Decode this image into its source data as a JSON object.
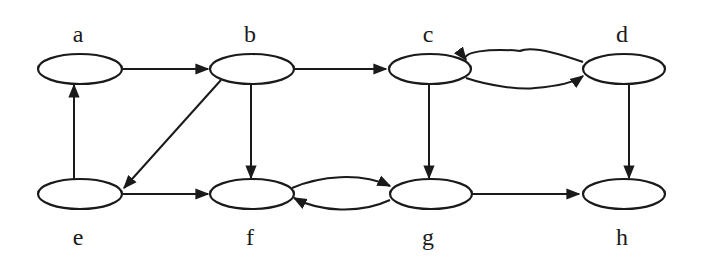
{
  "diagram": {
    "type": "directed-graph",
    "colors": {
      "stroke": "#1a1a1a",
      "background": "#ffffff",
      "node_fill": "#ffffff"
    },
    "nodes": [
      {
        "id": "a",
        "label": "a",
        "cx": 80,
        "cy": 69,
        "label_x": 78,
        "label_y": 42
      },
      {
        "id": "b",
        "label": "b",
        "cx": 252,
        "cy": 69,
        "label_x": 250,
        "label_y": 42
      },
      {
        "id": "c",
        "label": "c",
        "cx": 430,
        "cy": 69,
        "label_x": 428,
        "label_y": 42
      },
      {
        "id": "d",
        "label": "d",
        "cx": 623,
        "cy": 69,
        "label_x": 622,
        "label_y": 42
      },
      {
        "id": "e",
        "label": "e",
        "cx": 80,
        "cy": 194,
        "label_x": 78,
        "label_y": 245
      },
      {
        "id": "f",
        "label": "f",
        "cx": 252,
        "cy": 194,
        "label_x": 250,
        "label_y": 245
      },
      {
        "id": "g",
        "label": "g",
        "cx": 430,
        "cy": 194,
        "label_x": 428,
        "label_y": 245
      },
      {
        "id": "h",
        "label": "h",
        "cx": 623,
        "cy": 194,
        "label_x": 622,
        "label_y": 245
      }
    ],
    "edges": [
      {
        "from": "a",
        "to": "b"
      },
      {
        "from": "b",
        "to": "c"
      },
      {
        "from": "b",
        "to": "f"
      },
      {
        "from": "b",
        "to": "e"
      },
      {
        "from": "e",
        "to": "a"
      },
      {
        "from": "e",
        "to": "f"
      },
      {
        "from": "c",
        "to": "g"
      },
      {
        "from": "c",
        "to": "d"
      },
      {
        "from": "d",
        "to": "c"
      },
      {
        "from": "d",
        "to": "h"
      },
      {
        "from": "f",
        "to": "g"
      },
      {
        "from": "g",
        "to": "f"
      },
      {
        "from": "g",
        "to": "h"
      }
    ]
  }
}
